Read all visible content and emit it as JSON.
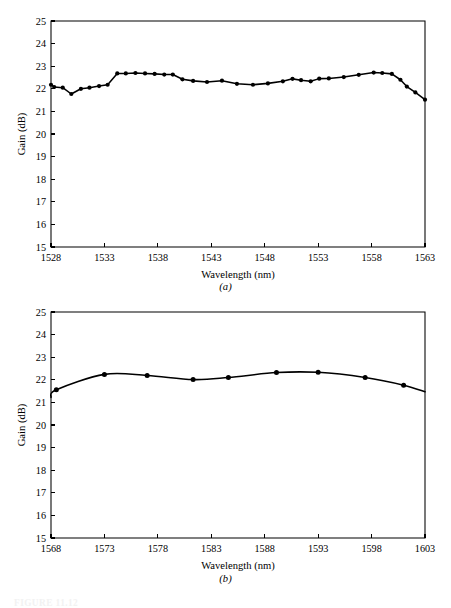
{
  "figure": {
    "caption": "FIGURE 11.12",
    "subcaption_a": "(a)",
    "subcaption_b": "(b)"
  },
  "chart_data": [
    {
      "type": "line",
      "panel": "a",
      "title": "",
      "xlabel": "Wavelength (nm)",
      "ylabel": "Gain (dB)",
      "xlim": [
        1528,
        1563
      ],
      "ylim": [
        15,
        25
      ],
      "xticks": [
        1528,
        1533,
        1538,
        1543,
        1548,
        1553,
        1558,
        1563
      ],
      "yticks": [
        15,
        16,
        17,
        18,
        19,
        20,
        21,
        22,
        23,
        24,
        25
      ],
      "grid": false,
      "legend": null,
      "markers": true,
      "x": [
        1528.0,
        1528.3,
        1529.1,
        1529.9,
        1530.8,
        1531.6,
        1532.5,
        1533.3,
        1534.2,
        1535.0,
        1535.9,
        1536.8,
        1537.7,
        1538.6,
        1539.4,
        1540.3,
        1541.3,
        1542.6,
        1544.0,
        1545.4,
        1546.9,
        1548.3,
        1549.7,
        1550.6,
        1551.4,
        1552.3,
        1553.1,
        1554.0,
        1555.4,
        1556.8,
        1558.2,
        1559.0,
        1559.9,
        1560.7,
        1561.3,
        1562.1,
        1563.0
      ],
      "y": [
        22.18,
        22.08,
        22.05,
        21.77,
        22.0,
        22.05,
        22.12,
        22.18,
        22.68,
        22.68,
        22.7,
        22.68,
        22.66,
        22.63,
        22.63,
        22.42,
        22.35,
        22.3,
        22.36,
        22.22,
        22.18,
        22.24,
        22.33,
        22.44,
        22.38,
        22.33,
        22.45,
        22.46,
        22.52,
        22.62,
        22.72,
        22.7,
        22.66,
        22.4,
        22.1,
        21.84,
        21.52
      ],
      "series": [
        {
          "name": "C-band gain",
          "values": [
            22.18,
            22.08,
            22.05,
            21.77,
            22.0,
            22.05,
            22.12,
            22.18,
            22.68,
            22.68,
            22.7,
            22.68,
            22.66,
            22.63,
            22.63,
            22.42,
            22.35,
            22.3,
            22.36,
            22.22,
            22.18,
            22.24,
            22.33,
            22.44,
            22.38,
            22.33,
            22.45,
            22.46,
            22.52,
            22.62,
            22.72,
            22.7,
            22.66,
            22.4,
            22.1,
            21.84,
            21.52
          ]
        }
      ]
    },
    {
      "type": "line",
      "panel": "b",
      "title": "",
      "xlabel": "Wavelength (nm)",
      "ylabel": "Gain (dB)",
      "xlim": [
        1568,
        1603
      ],
      "ylim": [
        15,
        25
      ],
      "xticks": [
        1568,
        1573,
        1578,
        1583,
        1588,
        1593,
        1598,
        1603
      ],
      "yticks": [
        15,
        16,
        17,
        18,
        19,
        20,
        21,
        22,
        23,
        24,
        25
      ],
      "grid": false,
      "legend": null,
      "markers": true,
      "x": [
        1568.5,
        1573.0,
        1577.0,
        1581.3,
        1584.6,
        1589.1,
        1593.0,
        1597.4,
        1601.0
      ],
      "y": [
        21.56,
        22.24,
        22.19,
        22.01,
        22.1,
        22.32,
        22.33,
        22.1,
        21.76
      ],
      "curve_endpoints": {
        "left": {
          "x": 1568.0,
          "y": 21.22
        },
        "right": {
          "x": 1603.0,
          "y": 21.47
        }
      },
      "series": [
        {
          "name": "L-band gain",
          "values": [
            21.56,
            22.24,
            22.19,
            22.01,
            22.1,
            22.32,
            22.33,
            22.1,
            21.76
          ]
        }
      ]
    }
  ]
}
